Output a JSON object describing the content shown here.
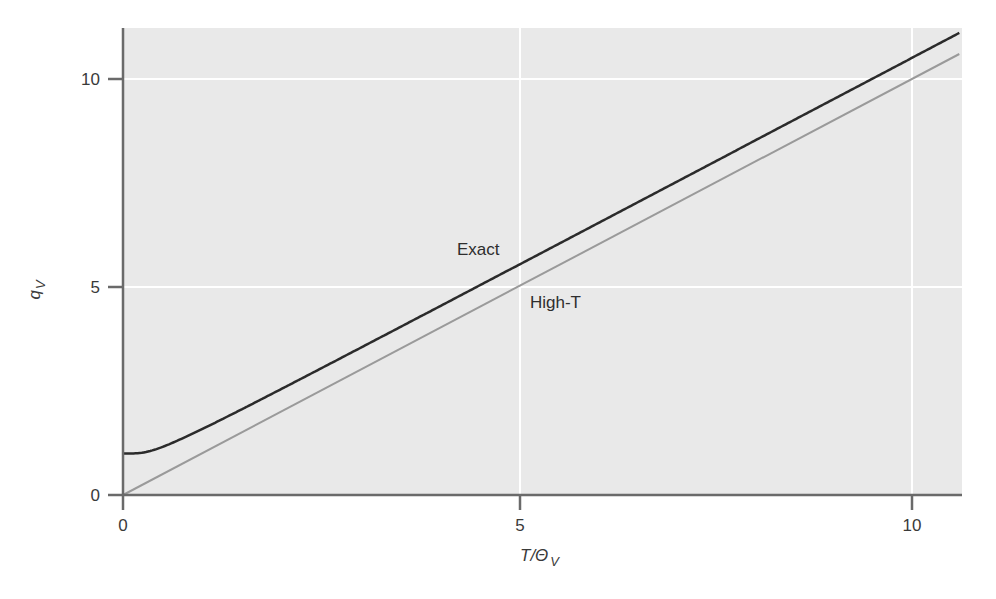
{
  "chart_data": {
    "type": "line",
    "title": "",
    "xlabel": "T/Θ_V",
    "ylabel": "q_V",
    "xlim": [
      0,
      10.6
    ],
    "ylim": [
      0,
      11.2
    ],
    "x_ticks": [
      0,
      5,
      10
    ],
    "y_ticks": [
      0,
      5,
      10
    ],
    "grid": true,
    "legend": "inline labels",
    "series": [
      {
        "name": "Exact",
        "formula": "1/(1 - exp(-Θ_V/T))",
        "color": "#2b2b2b",
        "x": [
          0,
          0.2,
          0.4,
          0.6,
          0.8,
          1,
          1.5,
          2,
          3,
          4,
          5,
          6,
          7,
          8,
          9,
          10,
          10.6
        ],
        "values": [
          1.0,
          1.01,
          1.09,
          1.23,
          1.4,
          1.58,
          2.05,
          2.54,
          3.53,
          4.52,
          5.52,
          6.51,
          7.51,
          8.51,
          9.51,
          10.51,
          11.11
        ]
      },
      {
        "name": "High-T",
        "formula": "T/Θ_V",
        "color": "#9a9a9a",
        "x": [
          0,
          10.6
        ],
        "values": [
          0,
          10.6
        ]
      }
    ],
    "annotations": [
      {
        "text": "Exact",
        "x": 4.2,
        "y": 5.9
      },
      {
        "text": "High-T",
        "x": 5.2,
        "y": 4.6
      }
    ]
  },
  "axes": {
    "x_tick_labels": [
      "0",
      "5",
      "10"
    ],
    "y_tick_labels": [
      "0",
      "5",
      "10"
    ],
    "xlabel_main": "T/Θ",
    "xlabel_sub": "V",
    "ylabel_main": "q",
    "ylabel_sub": "V"
  },
  "labels": {
    "exact": "Exact",
    "hight": "High-T"
  },
  "colors": {
    "plot_bg": "#e9e9e9",
    "grid": "#ffffff",
    "axis": "#6a6a6a",
    "exact": "#2b2b2b",
    "hight": "#9a9a9a"
  }
}
